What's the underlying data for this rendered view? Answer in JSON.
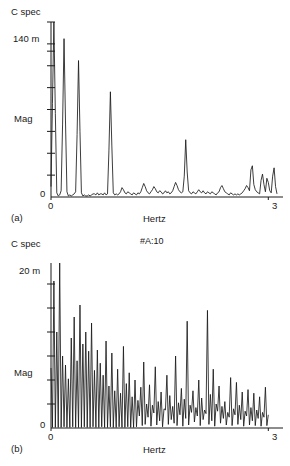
{
  "figure": {
    "annotation": "#A:10",
    "background_color": "#ffffff",
    "line_color": "#1a1a1a",
    "axis_color": "#1a1a1a"
  },
  "panel_a": {
    "caption": "(a)",
    "y_title": "C spec",
    "y_axis_label": "Mag",
    "y_max_label": "140 m",
    "y_zero_label": "0",
    "x_min_label": "0",
    "x_max_label": "3",
    "x_axis_label": "Hertz"
  },
  "panel_b": {
    "caption": "(b)",
    "y_title": "C spec",
    "y_axis_label": "Mag",
    "y_max_label": "20 m",
    "y_zero_label": "0",
    "x_min_label": "0",
    "x_max_label": "3",
    "x_axis_label": "Hertz"
  },
  "chart_data": [
    {
      "type": "line",
      "id": "panel_a",
      "title": "C spec",
      "xlabel": "Hertz",
      "ylabel": "Mag",
      "xlim": [
        0,
        3.12
      ],
      "ylim": [
        0,
        0.168
      ],
      "ytick_values": [
        0,
        0.021,
        0.042,
        0.063,
        0.084,
        0.105,
        0.126,
        0.14,
        0.147,
        0.168
      ],
      "ytick_labels": [
        "0",
        "",
        "",
        "",
        "",
        "",
        "",
        "140 m",
        "",
        ""
      ],
      "xtick_values": [
        0,
        3
      ],
      "xtick_labels": [
        "0",
        "3"
      ],
      "grid": false,
      "legend": false,
      "x": [
        0.0,
        0.02,
        0.04,
        0.06,
        0.08,
        0.1,
        0.12,
        0.14,
        0.16,
        0.18,
        0.2,
        0.22,
        0.24,
        0.26,
        0.28,
        0.3,
        0.32,
        0.34,
        0.36,
        0.38,
        0.4,
        0.42,
        0.44,
        0.46,
        0.48,
        0.5,
        0.52,
        0.54,
        0.56,
        0.58,
        0.6,
        0.62,
        0.64,
        0.66,
        0.68,
        0.7,
        0.72,
        0.74,
        0.76,
        0.78,
        0.8,
        0.82,
        0.84,
        0.86,
        0.88,
        0.9,
        0.92,
        0.94,
        0.96,
        0.98,
        1.0,
        1.02,
        1.04,
        1.06,
        1.08,
        1.1,
        1.12,
        1.14,
        1.16,
        1.18,
        1.2,
        1.22,
        1.24,
        1.26,
        1.28,
        1.3,
        1.32,
        1.34,
        1.36,
        1.38,
        1.4,
        1.42,
        1.44,
        1.46,
        1.48,
        1.5,
        1.52,
        1.54,
        1.56,
        1.58,
        1.6,
        1.62,
        1.64,
        1.66,
        1.68,
        1.7,
        1.72,
        1.74,
        1.76,
        1.78,
        1.8,
        1.82,
        1.84,
        1.86,
        1.88,
        1.9,
        1.92,
        1.94,
        1.96,
        1.98,
        2.0,
        2.02,
        2.04,
        2.06,
        2.08,
        2.1,
        2.12,
        2.14,
        2.16,
        2.18,
        2.2,
        2.22,
        2.24,
        2.26,
        2.28,
        2.3,
        2.32,
        2.34,
        2.36,
        2.38,
        2.4,
        2.42,
        2.44,
        2.46,
        2.48,
        2.5,
        2.52,
        2.54,
        2.56,
        2.58,
        2.6,
        2.62,
        2.64,
        2.66,
        2.68,
        2.7,
        2.72,
        2.74,
        2.76,
        2.78,
        2.8,
        2.82,
        2.84,
        2.86,
        2.88,
        2.9,
        2.92,
        2.94,
        2.96,
        2.98,
        3.0,
        3.02,
        3.04,
        3.06,
        3.08,
        3.1,
        3.12
      ],
      "y": [
        0.01,
        0.09,
        0.168,
        0.08,
        0.004,
        0.001,
        0.002,
        0.006,
        0.07,
        0.152,
        0.073,
        0.005,
        0.001,
        0.002,
        0.001,
        0.002,
        0.003,
        0.005,
        0.06,
        0.131,
        0.063,
        0.004,
        0.001,
        0.002,
        0.001,
        0.001,
        0.002,
        0.001,
        0.002,
        0.003,
        0.003,
        0.002,
        0.004,
        0.002,
        0.003,
        0.003,
        0.002,
        0.004,
        0.002,
        0.003,
        0.045,
        0.101,
        0.049,
        0.004,
        0.002,
        0.003,
        0.002,
        0.003,
        0.005,
        0.009,
        0.007,
        0.004,
        0.003,
        0.005,
        0.004,
        0.003,
        0.002,
        0.004,
        0.003,
        0.002,
        0.004,
        0.003,
        0.005,
        0.009,
        0.013,
        0.01,
        0.006,
        0.004,
        0.003,
        0.005,
        0.007,
        0.01,
        0.008,
        0.005,
        0.004,
        0.006,
        0.005,
        0.003,
        0.004,
        0.006,
        0.004,
        0.005,
        0.003,
        0.004,
        0.006,
        0.01,
        0.014,
        0.011,
        0.007,
        0.005,
        0.004,
        0.005,
        0.02,
        0.055,
        0.024,
        0.006,
        0.004,
        0.003,
        0.005,
        0.004,
        0.003,
        0.005,
        0.007,
        0.005,
        0.004,
        0.006,
        0.004,
        0.003,
        0.005,
        0.004,
        0.003,
        0.005,
        0.004,
        0.003,
        0.002,
        0.004,
        0.005,
        0.009,
        0.011,
        0.008,
        0.005,
        0.004,
        0.003,
        0.002,
        0.004,
        0.003,
        0.002,
        0.003,
        0.002,
        0.003,
        0.002,
        0.003,
        0.004,
        0.006,
        0.008,
        0.011,
        0.009,
        0.006,
        0.026,
        0.03,
        0.012,
        0.007,
        0.005,
        0.004,
        0.003,
        0.016,
        0.022,
        0.012,
        0.005,
        0.018,
        0.014,
        0.006,
        0.004,
        0.02,
        0.028,
        0.01,
        0.003
      ],
      "description": "Sparse harmonic spectrum with four dominant decaying peaks near 0.04, 0.18, 0.36 and 0.82 Hz, a moderate peak near 1.86 Hz, and low-level broadband noise across the remainder."
    },
    {
      "type": "line",
      "id": "panel_b",
      "title": "C spec",
      "xlabel": "Hertz",
      "ylabel": "Mag",
      "xlim": [
        0,
        3.12
      ],
      "ylim": [
        0,
        0.0275
      ],
      "ytick_values": [
        0,
        0.004,
        0.008,
        0.012,
        0.016,
        0.02,
        0.024
      ],
      "ytick_labels": [
        "0",
        "",
        "",
        "",
        "",
        "20 m",
        ""
      ],
      "xtick_values": [
        0,
        3
      ],
      "xtick_labels": [
        "0",
        "3"
      ],
      "grid": false,
      "legend": false,
      "x": [
        0.0,
        0.02,
        0.04,
        0.06,
        0.08,
        0.1,
        0.12,
        0.14,
        0.16,
        0.18,
        0.2,
        0.22,
        0.24,
        0.26,
        0.28,
        0.3,
        0.32,
        0.34,
        0.36,
        0.38,
        0.4,
        0.42,
        0.44,
        0.46,
        0.48,
        0.5,
        0.52,
        0.54,
        0.56,
        0.58,
        0.6,
        0.62,
        0.64,
        0.66,
        0.68,
        0.7,
        0.72,
        0.74,
        0.76,
        0.78,
        0.8,
        0.82,
        0.84,
        0.86,
        0.88,
        0.9,
        0.92,
        0.94,
        0.96,
        0.98,
        1.0,
        1.02,
        1.04,
        1.06,
        1.08,
        1.1,
        1.12,
        1.14,
        1.16,
        1.18,
        1.2,
        1.22,
        1.24,
        1.26,
        1.28,
        1.3,
        1.32,
        1.34,
        1.36,
        1.38,
        1.4,
        1.42,
        1.44,
        1.46,
        1.48,
        1.5,
        1.52,
        1.54,
        1.56,
        1.58,
        1.6,
        1.62,
        1.64,
        1.66,
        1.68,
        1.7,
        1.72,
        1.74,
        1.76,
        1.78,
        1.8,
        1.82,
        1.84,
        1.86,
        1.88,
        1.9,
        1.92,
        1.94,
        1.96,
        1.98,
        2.0,
        2.02,
        2.04,
        2.06,
        2.08,
        2.1,
        2.12,
        2.14,
        2.16,
        2.18,
        2.2,
        2.22,
        2.24,
        2.26,
        2.28,
        2.3,
        2.32,
        2.34,
        2.36,
        2.38,
        2.4,
        2.42,
        2.44,
        2.46,
        2.48,
        2.5,
        2.52,
        2.54,
        2.56,
        2.58,
        2.6,
        2.62,
        2.64,
        2.66,
        2.68,
        2.7,
        2.72,
        2.74,
        2.76,
        2.78,
        2.8,
        2.82,
        2.84,
        2.86,
        2.88,
        2.9,
        2.92,
        2.94,
        2.96,
        2.98,
        3.0,
        3.02,
        3.04,
        3.06,
        3.08,
        3.1,
        3.12
      ],
      "y": [
        0.01,
        0.0001,
        0.0245,
        0.0001,
        0.016,
        0.0001,
        0.0275,
        0.0001,
        0.012,
        0.0002,
        0.0105,
        0.0001,
        0.0082,
        0.0001,
        0.015,
        0.0002,
        0.0185,
        0.0001,
        0.0112,
        0.0001,
        0.0205,
        0.0001,
        0.014,
        0.0002,
        0.016,
        0.0001,
        0.0128,
        0.0001,
        0.0175,
        0.0002,
        0.0096,
        0.0001,
        0.013,
        0.0001,
        0.0108,
        0.0002,
        0.0088,
        0.0001,
        0.0145,
        0.0001,
        0.007,
        0.0002,
        0.0125,
        0.0001,
        0.0062,
        0.0001,
        0.0098,
        0.0002,
        0.0058,
        0.0001,
        0.0136,
        0.0001,
        0.0074,
        0.0002,
        0.0092,
        0.0001,
        0.0052,
        0.0001,
        0.008,
        0.0002,
        0.0046,
        0.002,
        0.0068,
        0.0004,
        0.011,
        0.0006,
        0.004,
        0.0018,
        0.0072,
        0.0003,
        0.0038,
        0.0025,
        0.0102,
        0.0005,
        0.0044,
        0.0012,
        0.006,
        0.0002,
        0.0032,
        0.003,
        0.0088,
        0.0006,
        0.0054,
        0.0014,
        0.0036,
        0.0008,
        0.012,
        0.0004,
        0.0042,
        0.0022,
        0.0066,
        0.0003,
        0.0048,
        0.0016,
        0.0178,
        0.0005,
        0.0038,
        0.0026,
        0.0062,
        0.001,
        0.0034,
        0.002,
        0.008,
        0.0004,
        0.005,
        0.0014,
        0.003,
        0.0024,
        0.0196,
        0.0006,
        0.0056,
        0.0012,
        0.0098,
        0.0003,
        0.004,
        0.0028,
        0.007,
        0.0008,
        0.0036,
        0.0016,
        0.0044,
        0.0005,
        0.0026,
        0.0018,
        0.0084,
        0.0004,
        0.0032,
        0.0022,
        0.0076,
        0.0006,
        0.0038,
        0.0014,
        0.006,
        0.0003,
        0.0028,
        0.002,
        0.0064,
        0.0005,
        0.0034,
        0.0012,
        0.0058,
        0.0004,
        0.003,
        0.0016,
        0.0052,
        0.0003,
        0.0026,
        0.0018,
        0.0068,
        0.0004,
        0.0022
      ],
      "description": "Dense comb-like spectrum with closely spaced spikes decaying from about 27.5 m near 0.06 Hz toward 5 m at 3 Hz, with notable secondary maxima near 1.88 and 2.22 Hz."
    }
  ]
}
